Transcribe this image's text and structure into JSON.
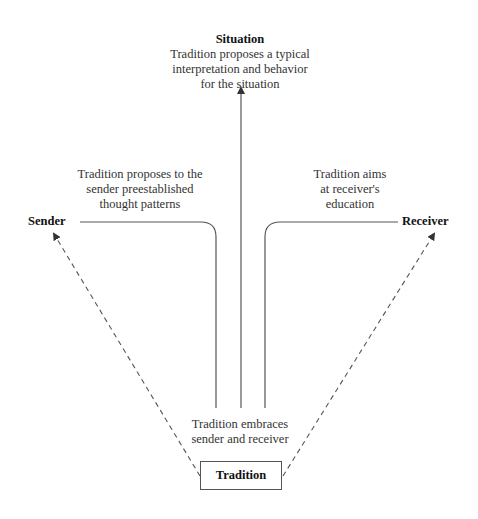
{
  "diagram": {
    "situation": {
      "title": "Situation",
      "lines": [
        "Tradition proposes a typical",
        "interpretation and behavior",
        "for the situation"
      ]
    },
    "sender": {
      "title": "Sender",
      "annotation": [
        "Tradition proposes to the",
        "sender preestablished",
        "thought patterns"
      ]
    },
    "receiver": {
      "title": "Receiver",
      "annotation": [
        "Tradition aims",
        "at receiver's",
        "education"
      ]
    },
    "embrace": {
      "lines": [
        "Tradition embraces",
        "sender and receiver"
      ]
    },
    "tradition": {
      "title": "Tradition"
    },
    "colors": {
      "line": "#555555",
      "text": "#333333",
      "background": "#ffffff"
    }
  }
}
